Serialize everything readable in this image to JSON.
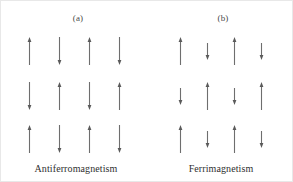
{
  "figure": {
    "background_color": "#ffffff",
    "arrow_color": "#6e6e6e",
    "text_color": "#2f2f2f"
  },
  "panels": [
    {
      "label": "(a)",
      "caption": "Antiferromagnetism",
      "rows": [
        [
          {
            "direction": "up",
            "length": "long"
          },
          {
            "direction": "down",
            "length": "long"
          },
          {
            "direction": "up",
            "length": "long"
          },
          {
            "direction": "down",
            "length": "long"
          }
        ],
        [
          {
            "direction": "down",
            "length": "long"
          },
          {
            "direction": "up",
            "length": "long"
          },
          {
            "direction": "down",
            "length": "long"
          },
          {
            "direction": "up",
            "length": "long"
          }
        ],
        [
          {
            "direction": "up",
            "length": "long"
          },
          {
            "direction": "down",
            "length": "long"
          },
          {
            "direction": "up",
            "length": "long"
          },
          {
            "direction": "down",
            "length": "long"
          }
        ]
      ]
    },
    {
      "label": "(b)",
      "caption": "Ferrimagnetism",
      "rows": [
        [
          {
            "direction": "up",
            "length": "long"
          },
          {
            "direction": "down",
            "length": "short"
          },
          {
            "direction": "up",
            "length": "long"
          },
          {
            "direction": "down",
            "length": "short"
          }
        ],
        [
          {
            "direction": "down",
            "length": "short"
          },
          {
            "direction": "up",
            "length": "long"
          },
          {
            "direction": "down",
            "length": "short"
          },
          {
            "direction": "up",
            "length": "long"
          }
        ],
        [
          {
            "direction": "up",
            "length": "long"
          },
          {
            "direction": "down",
            "length": "short"
          },
          {
            "direction": "up",
            "length": "long"
          },
          {
            "direction": "down",
            "length": "short"
          }
        ]
      ]
    }
  ]
}
